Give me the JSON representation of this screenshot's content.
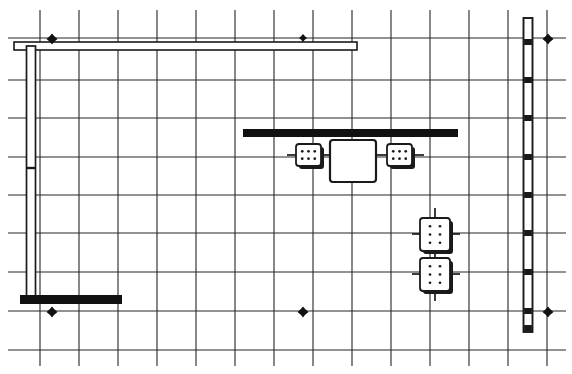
{
  "drawing": {
    "title": "Architectural Floor Plan Fragment",
    "type": "floor-plan",
    "canvas": {
      "width": 572,
      "height": 374
    },
    "background_color": "#ffffff",
    "ink_color": "#1a1a1a",
    "grid_color": "#262626",
    "wall_fill_color": "#ffffff",
    "solid_fill_color": "#111111"
  },
  "grid": {
    "label": "Structural column grid",
    "line_color": "#262626",
    "line_width": 1.1,
    "vertical_x": [
      40,
      79,
      118,
      157,
      196,
      235,
      274,
      313,
      352,
      391,
      430,
      469,
      508,
      547
    ],
    "horizontal_y": [
      38,
      80,
      118,
      157,
      195,
      233,
      272,
      311,
      350
    ],
    "vertical_top": 10,
    "vertical_bottom": 366,
    "horizontal_left": 8,
    "horizontal_right": 566
  },
  "markers": {
    "label": "Grid reference datum markers",
    "shape": "four-point-diamond",
    "color": "#111111",
    "points": [
      {
        "name": "datum-top-left",
        "x": 52,
        "y": 39,
        "size": 11
      },
      {
        "name": "datum-top-center",
        "x": 303,
        "y": 38,
        "size": 8
      },
      {
        "name": "datum-top-right",
        "x": 548,
        "y": 39,
        "size": 11
      },
      {
        "name": "datum-bottom-left",
        "x": 52,
        "y": 312,
        "size": 11
      },
      {
        "name": "datum-bottom-center",
        "x": 303,
        "y": 312,
        "size": 11
      },
      {
        "name": "datum-bottom-right",
        "x": 548,
        "y": 312,
        "size": 11
      }
    ]
  },
  "walls": {
    "top_cavity_wall": {
      "label": "Upper horizontal cavity wall",
      "orientation": "horizontal",
      "x1": 14,
      "x2": 357,
      "y": 46,
      "thickness": 8
    },
    "left_cavity_wall": {
      "label": "Left vertical cavity wall",
      "orientation": "vertical",
      "x": 31,
      "y1": 46,
      "y2": 300,
      "thickness": 9,
      "joint_y": [
        168
      ]
    },
    "right_curtain_wall": {
      "label": "Right vertical curtain wall with mullions",
      "orientation": "vertical",
      "x": 528,
      "y1": 18,
      "y2": 332,
      "thickness": 9,
      "mullion_y": [
        42,
        80,
        118,
        157,
        195,
        233,
        272,
        311,
        328
      ]
    }
  },
  "solid_elements": [
    {
      "name": "center-beam",
      "label": "Central structural beam",
      "x": 243,
      "y": 129,
      "width": 215,
      "height": 8,
      "color": "#111111"
    },
    {
      "name": "lower-left-footing",
      "label": "Lower left footing bar",
      "x": 20,
      "y": 295,
      "width": 102,
      "height": 9,
      "color": "#111111"
    }
  ],
  "equipment": [
    {
      "name": "junction-box-left",
      "label": "Junction box (left of core)",
      "x": 296,
      "y": 144,
      "width": 25,
      "height": 22,
      "dot_cols": 3,
      "dot_rows": 2,
      "shadow": true
    },
    {
      "name": "junction-box-right",
      "label": "Junction box (right of core)",
      "x": 387,
      "y": 144,
      "width": 25,
      "height": 22,
      "dot_cols": 3,
      "dot_rows": 2,
      "shadow": true
    },
    {
      "name": "equipment-box-upper",
      "label": "Equipment cabinet (upper)",
      "x": 420,
      "y": 218,
      "width": 30,
      "height": 33,
      "dot_cols": 2,
      "dot_rows": 3,
      "shadow": true
    },
    {
      "name": "equipment-box-lower",
      "label": "Equipment cabinet (lower)",
      "x": 420,
      "y": 258,
      "width": 30,
      "height": 33,
      "dot_cols": 2,
      "dot_rows": 3,
      "shadow": true
    }
  ],
  "core": {
    "name": "central-core",
    "label": "Central service core / shaft",
    "x": 330,
    "y": 140,
    "width": 46,
    "height": 42,
    "stroke_width": 2.2
  },
  "connectors": [
    {
      "name": "connector-core-to-left-box",
      "x1": 321,
      "y1": 155,
      "x2": 330,
      "y2": 155
    },
    {
      "name": "connector-core-to-right-box",
      "x1": 376,
      "y1": 155,
      "x2": 387,
      "y2": 155
    },
    {
      "name": "connector-left-box-lead",
      "x1": 287,
      "y1": 155,
      "x2": 296,
      "y2": 155
    },
    {
      "name": "connector-right-box-lead",
      "x1": 412,
      "y1": 155,
      "x2": 424,
      "y2": 155
    },
    {
      "name": "connector-upper-cabinet-top",
      "x1": 435,
      "y1": 208,
      "x2": 435,
      "y2": 218
    },
    {
      "name": "connector-upper-cabinet-bottom",
      "x1": 435,
      "y1": 251,
      "x2": 435,
      "y2": 258
    },
    {
      "name": "connector-lower-cabinet-bottom",
      "x1": 435,
      "y1": 291,
      "x2": 435,
      "y2": 301
    },
    {
      "name": "connector-upper-cabinet-left",
      "x1": 412,
      "y1": 234,
      "x2": 420,
      "y2": 234
    },
    {
      "name": "connector-upper-cabinet-right",
      "x1": 450,
      "y1": 234,
      "x2": 460,
      "y2": 234
    },
    {
      "name": "connector-lower-cabinet-left",
      "x1": 412,
      "y1": 274,
      "x2": 420,
      "y2": 274
    },
    {
      "name": "connector-lower-cabinet-right",
      "x1": 450,
      "y1": 274,
      "x2": 460,
      "y2": 274
    }
  ]
}
